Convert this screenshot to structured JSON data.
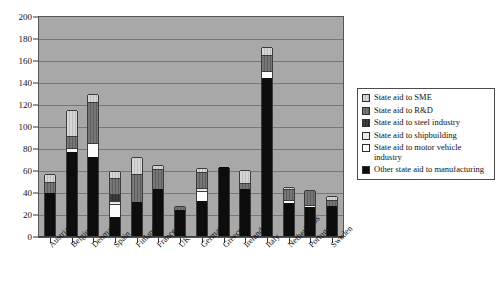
{
  "chart_data": {
    "type": "bar",
    "subtype": "stacked-vertical",
    "title": "",
    "xlabel": "",
    "ylabel": "",
    "ylim": [
      0,
      200
    ],
    "ytick_step": 20,
    "yticks": [
      0,
      20,
      40,
      60,
      80,
      100,
      120,
      140,
      160,
      180,
      200
    ],
    "grid": true,
    "legend_position": "right",
    "plot_background": "#a8a8a8",
    "categories": [
      "Austria",
      "Belgium",
      "Denmark",
      "Spain",
      "Finland",
      "France",
      "UK",
      "Germany",
      "Greece",
      "Ireland",
      "Italy",
      "Netherlands",
      "Portugal",
      "Sweden"
    ],
    "series": [
      {
        "name": "Other state aid to manufacturing",
        "color": "#0d0d0d",
        "values": [
          39,
          76,
          72,
          17,
          31,
          43,
          24,
          32,
          63,
          43,
          144,
          30,
          26,
          27
        ]
      },
      {
        "name": "State aid to motor vehicle industry",
        "color": "#fbfbfb",
        "values": [
          0,
          4,
          13,
          12,
          0,
          0,
          0,
          9,
          0,
          0,
          6,
          3,
          2,
          0
        ]
      },
      {
        "name": "State aid to shipbuilding",
        "color": "#e9e9e9",
        "values": [
          0,
          0,
          0,
          3,
          0,
          0,
          0,
          3,
          0,
          0,
          0,
          0,
          0,
          0
        ]
      },
      {
        "name": "State aid to steel industry",
        "color": "#3d3d3d",
        "values": [
          0,
          0,
          0,
          6,
          0,
          0,
          0,
          0,
          0,
          0,
          0,
          0,
          0,
          0
        ]
      },
      {
        "name": "State aid to R&D",
        "color": "#6f6f6f",
        "values": [
          10,
          11,
          37,
          15,
          25,
          18,
          3,
          14,
          0,
          5,
          15,
          10,
          14,
          6
        ]
      },
      {
        "name": "State aid to SME",
        "color": "#cfcfcf",
        "values": [
          7,
          24,
          7,
          6,
          16,
          4,
          0,
          4,
          0,
          12,
          7,
          2,
          0,
          3
        ]
      }
    ],
    "totals": [
      56,
      115,
      129,
      59,
      72,
      65,
      27,
      62,
      63,
      60,
      172,
      45,
      42,
      36
    ]
  },
  "legend": {
    "items": [
      {
        "label": "State aid to SME",
        "swatch": "sme-swatch"
      },
      {
        "label": "State aid to R&D",
        "swatch": "rd-swatch"
      },
      {
        "label": "State aid to steel industry",
        "swatch": "steel-swatch"
      },
      {
        "label": "State aid to shipbuilding",
        "swatch": "shipbuilding-swatch"
      },
      {
        "label": "State aid to motor vehicle industry",
        "swatch": "motor-vehicle-swatch"
      },
      {
        "label": "Other state aid to manufacturing",
        "swatch": "other-manufacturing-swatch"
      }
    ]
  }
}
